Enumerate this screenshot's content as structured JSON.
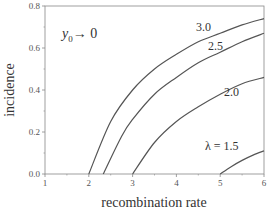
{
  "chart_data": {
    "type": "line",
    "title": "",
    "xlabel": "recombination rate",
    "ylabel": "incidence",
    "xlim": [
      1,
      6
    ],
    "ylim": [
      0,
      0.8
    ],
    "x_ticks": [
      "1",
      "2",
      "3",
      "4",
      "5",
      "6"
    ],
    "y_ticks": [
      "0.0",
      "0.2",
      "0.4",
      "0.6",
      "0.8"
    ],
    "grid": false,
    "annotation": "y0 → 0",
    "annotation_parts": {
      "main": "y",
      "sub": "0",
      "rest": "→ 0"
    },
    "series": [
      {
        "name": "3.0",
        "label": "3.0",
        "x": [
          2.0,
          2.5,
          3.0,
          3.5,
          4.0,
          4.5,
          5.0,
          5.5,
          6.0
        ],
        "y": [
          0.0,
          0.25,
          0.4,
          0.5,
          0.57,
          0.63,
          0.67,
          0.71,
          0.74
        ]
      },
      {
        "name": "2.5",
        "label": "2.5",
        "x": [
          2.33,
          2.75,
          3.0,
          3.5,
          4.0,
          4.5,
          5.0,
          5.5,
          6.0
        ],
        "y": [
          0.0,
          0.18,
          0.26,
          0.38,
          0.46,
          0.53,
          0.58,
          0.63,
          0.67
        ]
      },
      {
        "name": "2.0",
        "label": "2.0",
        "x": [
          3.0,
          3.5,
          4.0,
          4.5,
          5.0,
          5.5,
          6.0
        ],
        "y": [
          0.0,
          0.15,
          0.25,
          0.32,
          0.38,
          0.43,
          0.46
        ]
      },
      {
        "name": "1.5",
        "label": "λ = 1.5",
        "x": [
          5.0,
          5.25,
          5.5,
          5.75,
          6.0
        ],
        "y": [
          0.0,
          0.035,
          0.065,
          0.09,
          0.11
        ]
      }
    ]
  }
}
